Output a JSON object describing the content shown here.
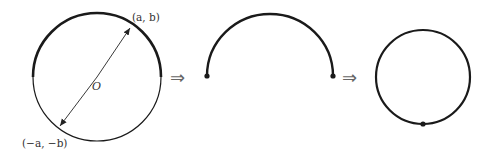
{
  "diagram": {
    "stages": [
      {
        "name": "circle",
        "labels": {
          "top_point": "(a, b)",
          "bottom_point": "(−a, −b)",
          "center": "O"
        }
      },
      {
        "name": "semicircle"
      },
      {
        "name": "result-circle"
      }
    ],
    "arrows": [
      "⇒",
      "⇒"
    ],
    "colors": {
      "stroke": "#1a1a1a",
      "text": "#333333",
      "arrow": "#666666"
    }
  }
}
